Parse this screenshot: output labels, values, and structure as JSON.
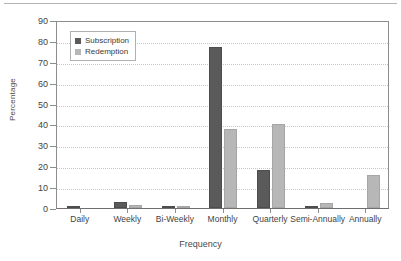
{
  "chart_data": {
    "type": "bar",
    "title": "",
    "xlabel": "Frequency",
    "ylabel": "Percentage",
    "categories": [
      "Daily",
      "Weekly",
      "Bi-Weekly",
      "Monthly",
      "Quarterly",
      "Semi-Annually",
      "Annually"
    ],
    "series": [
      {
        "name": "Subscription",
        "color": "#5a5a5a",
        "values": [
          0.5,
          3,
          0.5,
          77,
          18,
          0.3,
          0
        ]
      },
      {
        "name": "Redemption",
        "color": "#b7b7b7",
        "values": [
          0,
          1.5,
          0.5,
          38,
          40,
          2.5,
          16
        ]
      }
    ],
    "ylim": [
      0,
      90
    ],
    "yticks": [
      0,
      10,
      20,
      30,
      40,
      50,
      60,
      70,
      80,
      90
    ],
    "ytick_labels": [
      "0",
      "10",
      "20",
      "30",
      "40",
      "50",
      "60",
      "70",
      "80",
      "90"
    ],
    "grid": true,
    "grid_axis": "y",
    "grid_style": "dotted",
    "legend_position": "upper-left",
    "legend_entries": [
      "Subscription",
      "Redemption"
    ],
    "background": "#ffffff",
    "axis_color": "#8d8d8d"
  }
}
